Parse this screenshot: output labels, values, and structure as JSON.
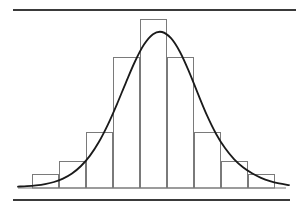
{
  "figure": {
    "title": "",
    "caption": "",
    "background_color": "#ffffff",
    "width": 302,
    "height": 217
  },
  "rules": {
    "top_rule": {
      "name": "top-horizontal-rule",
      "x1": 13,
      "y1": 10,
      "x2": 296,
      "y2": 10,
      "color": "#3a3a3a",
      "width": 2
    },
    "bottom_rule": {
      "name": "bottom-horizontal-rule",
      "x1": 13,
      "y1": 200,
      "x2": 290,
      "y2": 200,
      "color": "#3a3a3a",
      "width": 2
    }
  },
  "chart_data": {
    "type": "bar",
    "title": "",
    "subtitle": "",
    "xlabel": "",
    "ylabel": "",
    "grid": false,
    "legend": null,
    "axis_visible": false,
    "tick_labels_visible": false,
    "categories": [
      "1",
      "2",
      "3",
      "4",
      "5",
      "6",
      "7",
      "8",
      "9"
    ],
    "values": [
      5,
      16,
      42,
      108,
      120,
      108,
      42,
      16,
      5
    ],
    "ylim": [
      0,
      126
    ],
    "xlim": [
      0,
      9
    ],
    "bar_color": "#ffffff",
    "bar_edge_color": "#7a7a7a",
    "bar_edge_width": 1,
    "baseline_y_px": 188,
    "plot_left_px": 32,
    "plot_right_px": 275,
    "plot_top_px": 18,
    "bar_top_px": [
      174,
      161,
      132,
      57,
      19,
      57,
      132,
      161,
      174
    ],
    "bar_edges_px": [
      32,
      59,
      86,
      113,
      140,
      167,
      194,
      221,
      248,
      275
    ],
    "series": [
      {
        "name": "histogram",
        "type": "bar",
        "values": [
          5,
          16,
          42,
          108,
          120,
          108,
          42,
          16,
          5
        ]
      },
      {
        "name": "normal-curve",
        "type": "line",
        "color": "#1a1a1a",
        "line_width": 1.8,
        "description": "normal distribution density overlay",
        "mean_px": 153.5,
        "sigma_px": 35,
        "peak_px": 18,
        "x_start_px": 18,
        "x_end_px": 289,
        "points": [
          {
            "x": 18,
            "y": 186.6
          },
          {
            "x": 27,
            "y": 186.2
          },
          {
            "x": 36,
            "y": 185.4
          },
          {
            "x": 45,
            "y": 184.1
          },
          {
            "x": 54,
            "y": 182.0
          },
          {
            "x": 63,
            "y": 178.6
          },
          {
            "x": 72,
            "y": 173.5
          },
          {
            "x": 81,
            "y": 166.0
          },
          {
            "x": 90,
            "y": 155.6
          },
          {
            "x": 99,
            "y": 141.8
          },
          {
            "x": 108,
            "y": 124.4
          },
          {
            "x": 117,
            "y": 104.1
          },
          {
            "x": 126,
            "y": 82.3
          },
          {
            "x": 135,
            "y": 61.5
          },
          {
            "x": 144,
            "y": 44.6
          },
          {
            "x": 153,
            "y": 34.2
          },
          {
            "x": 162,
            "y": 32.0
          },
          {
            "x": 171,
            "y": 38.2
          },
          {
            "x": 180,
            "y": 52.0
          },
          {
            "x": 189,
            "y": 71.6
          },
          {
            "x": 198,
            "y": 93.9
          },
          {
            "x": 207,
            "y": 115.4
          },
          {
            "x": 216,
            "y": 133.7
          },
          {
            "x": 225,
            "y": 148.1
          },
          {
            "x": 234,
            "y": 159.1
          },
          {
            "x": 243,
            "y": 167.3
          },
          {
            "x": 252,
            "y": 173.3
          },
          {
            "x": 261,
            "y": 177.8
          },
          {
            "x": 270,
            "y": 181.1
          },
          {
            "x": 279,
            "y": 183.4
          },
          {
            "x": 289,
            "y": 185.2
          }
        ]
      }
    ]
  }
}
